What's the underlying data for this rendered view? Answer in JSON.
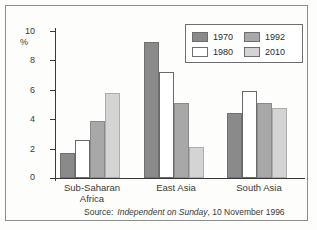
{
  "chart_data": {
    "type": "bar",
    "title": "",
    "xlabel": "",
    "ylabel": "%",
    "ylim": [
      0,
      10
    ],
    "yticks": [
      "0",
      "2",
      "4",
      "6",
      "8",
      "10"
    ],
    "grid": false,
    "legend_position": "top-right",
    "categories": [
      "Sub-Saharan Africa",
      "East Asia",
      "South Asia"
    ],
    "category_lines": [
      [
        "Sub-Saharan",
        "Africa"
      ],
      [
        "East Asia"
      ],
      [
        "South Asia"
      ]
    ],
    "series": [
      {
        "name": "1970",
        "color": "#8a8a8a",
        "values": [
          1.7,
          9.25,
          4.45
        ]
      },
      {
        "name": "1980",
        "color": "#ffffff",
        "values": [
          2.6,
          7.2,
          5.9
        ]
      },
      {
        "name": "1992",
        "color": "#a8a8a8",
        "values": [
          3.9,
          5.1,
          5.1
        ]
      },
      {
        "name": "2010",
        "color": "#d4d4d4",
        "values": [
          5.8,
          2.1,
          4.75
        ]
      }
    ],
    "annotations": {
      "source_label": "Source:",
      "source_publication": "Independent on Sunday",
      "source_rest": ", 10 November 1996"
    }
  }
}
